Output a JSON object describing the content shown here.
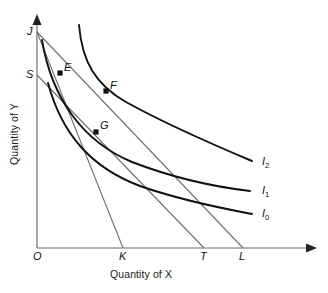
{
  "figure": {
    "kind": "indifference-curve-budget-line-diagram",
    "background": "#ffffff",
    "ink": "#111111",
    "thin_ink": "#6f6f6f"
  },
  "axes": {
    "x_title": "Quantity of X",
    "y_title": "Quantity of Y",
    "origin_label": "O",
    "x_axis_y": 248,
    "y_axis_x": 37,
    "x_axis_end": 315,
    "y_axis_top": 17
  },
  "y_intercepts": [
    {
      "label": "J",
      "x": 37,
      "y": 32,
      "label_x": 27,
      "label_y": 26
    },
    {
      "label": "S",
      "x": 37,
      "y": 75,
      "label_x": 26,
      "label_y": 69
    }
  ],
  "x_intercepts": [
    {
      "label": "O",
      "x": 37,
      "label_x": 33,
      "label_y": 251
    },
    {
      "label": "K",
      "x": 123,
      "label_x": 119,
      "label_y": 251
    },
    {
      "label": "T",
      "x": 204,
      "label_x": 200,
      "label_y": 251
    },
    {
      "label": "L",
      "x": 243,
      "label_x": 239,
      "label_y": 251
    }
  ],
  "tangency_points": [
    {
      "label": "E",
      "x": 60,
      "y": 73,
      "label_x": 65,
      "label_y": 62,
      "curve": "I1"
    },
    {
      "label": "F",
      "x": 106,
      "y": 91,
      "label_x": 111,
      "label_y": 80,
      "curve": "I2"
    },
    {
      "label": "G",
      "x": 96,
      "y": 132,
      "label_x": 101,
      "label_y": 120,
      "curve": "I1"
    }
  ],
  "budget_lines": [
    {
      "name": "JK",
      "from": "J",
      "to": "K",
      "x1": 37,
      "y1": 32,
      "x2": 123,
      "y2": 248
    },
    {
      "name": "JL",
      "from": "J",
      "to": "L",
      "x1": 37,
      "y1": 32,
      "x2": 243,
      "y2": 248
    },
    {
      "name": "ST",
      "from": "S",
      "to": "T",
      "x1": 37,
      "y1": 75,
      "x2": 204,
      "y2": 248
    }
  ],
  "indifference_curves": [
    {
      "name": "I0",
      "label": "I",
      "subscript": "0",
      "label_x": 262,
      "label_y": 208,
      "path": "M 48,83 C 62,135 92,168 140,186 C 180,200 220,208 252,214"
    },
    {
      "name": "I1",
      "label": "I",
      "subscript": "1",
      "label_x": 262,
      "label_y": 185,
      "path": "M 42,40 C 52,100 84,142 132,162 C 176,179 216,187 250,191"
    },
    {
      "name": "I2",
      "label": "I",
      "subscript": "2",
      "label_x": 262,
      "label_y": 156,
      "path": "M 79,25 C 82,62 96,85 126,102 C 162,122 214,145 252,161"
    }
  ]
}
